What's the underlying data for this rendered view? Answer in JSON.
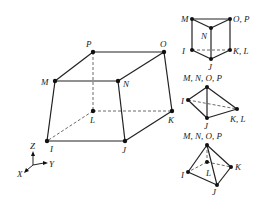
{
  "main_element": {
    "nodes": [
      {
        "id": "P",
        "x": 93,
        "y": 52,
        "lx": 86,
        "ly": 47
      },
      {
        "id": "O",
        "x": 164,
        "y": 52,
        "lx": 160,
        "ly": 47
      },
      {
        "id": "M",
        "x": 55,
        "y": 81,
        "lx": 41,
        "ly": 85
      },
      {
        "id": "N",
        "x": 118,
        "y": 81,
        "lx": 123,
        "ly": 87
      },
      {
        "id": "L",
        "x": 93,
        "y": 111,
        "lx": 90,
        "ly": 123
      },
      {
        "id": "K",
        "x": 172,
        "y": 111,
        "lx": 168,
        "ly": 123
      },
      {
        "id": "I",
        "x": 47,
        "y": 141,
        "lx": 50,
        "ly": 152
      },
      {
        "id": "J",
        "x": 125,
        "y": 141,
        "lx": 122,
        "ly": 153
      }
    ],
    "solid_edges": [
      [
        "P",
        "O"
      ],
      [
        "M",
        "N"
      ],
      [
        "P",
        "M"
      ],
      [
        "O",
        "N"
      ],
      [
        "O",
        "K"
      ],
      [
        "M",
        "I"
      ],
      [
        "N",
        "J"
      ],
      [
        "I",
        "J"
      ],
      [
        "J",
        "K"
      ]
    ],
    "hidden_edges": [
      [
        "P",
        "L"
      ],
      [
        "L",
        "K"
      ],
      [
        "L",
        "I"
      ]
    ]
  },
  "axes": {
    "labels": {
      "z": "Z",
      "y": "Y",
      "x": "X"
    }
  },
  "degenerate_elements": [
    {
      "name": "prism",
      "labels": [
        {
          "t": "M",
          "x": 181,
          "y": 22
        },
        {
          "t": "O, P",
          "x": 233,
          "y": 22
        },
        {
          "t": "N",
          "x": 201,
          "y": 39
        },
        {
          "t": "I",
          "x": 182,
          "y": 54
        },
        {
          "t": "K, L",
          "x": 233,
          "y": 54
        },
        {
          "t": "J",
          "x": 208,
          "y": 70
        }
      ],
      "points": [
        [
          192,
          19
        ],
        [
          230,
          19
        ],
        [
          211,
          28
        ],
        [
          192,
          50
        ],
        [
          230,
          50
        ],
        [
          211,
          59
        ]
      ],
      "solid": [
        [
          0,
          1
        ],
        [
          0,
          2
        ],
        [
          1,
          2
        ],
        [
          0,
          3
        ],
        [
          1,
          4
        ],
        [
          2,
          5
        ],
        [
          3,
          5
        ],
        [
          4,
          5
        ]
      ],
      "hidden": [
        [
          3,
          4
        ]
      ]
    },
    {
      "name": "tetrahedron",
      "labels": [
        {
          "t": "M, N, O, P",
          "x": 183,
          "y": 81
        },
        {
          "t": "I",
          "x": 181,
          "y": 104
        },
        {
          "t": "J",
          "x": 204,
          "y": 129
        },
        {
          "t": "K, L",
          "x": 230,
          "y": 122
        }
      ],
      "points": [
        [
          207,
          87
        ],
        [
          188,
          100
        ],
        [
          237,
          109
        ],
        [
          207,
          118
        ]
      ],
      "solid": [
        [
          0,
          1
        ],
        [
          0,
          2
        ],
        [
          0,
          3
        ],
        [
          1,
          3
        ],
        [
          3,
          2
        ]
      ],
      "hidden": [
        [
          1,
          2
        ]
      ]
    },
    {
      "name": "pyramid",
      "labels": [
        {
          "t": "M, N, O, P",
          "x": 183,
          "y": 139
        },
        {
          "t": "L",
          "x": 206,
          "y": 176
        },
        {
          "t": "I",
          "x": 181,
          "y": 178
        },
        {
          "t": "K",
          "x": 235,
          "y": 170
        },
        {
          "t": "J",
          "x": 212,
          "y": 195
        }
      ],
      "points": [
        [
          207,
          145
        ],
        [
          207,
          162
        ],
        [
          188,
          172
        ],
        [
          231,
          167
        ],
        [
          217,
          185
        ]
      ],
      "solid": [
        [
          0,
          2
        ],
        [
          0,
          3
        ],
        [
          0,
          4
        ],
        [
          2,
          4
        ],
        [
          4,
          3
        ]
      ],
      "hidden": [
        [
          0,
          1
        ],
        [
          1,
          2
        ],
        [
          1,
          3
        ]
      ]
    }
  ]
}
